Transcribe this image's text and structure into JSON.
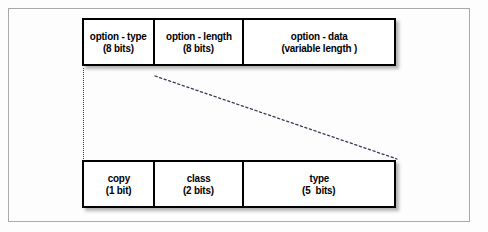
{
  "figure": {
    "frame_color": "#a9a9a9",
    "box_border_color": "#000000",
    "box_fill_color": "#ffffff",
    "text_color": "#000000",
    "connector_color": "#3a3a55"
  },
  "top_row": {
    "name": "option-format-row",
    "cells": [
      {
        "name": "option - type",
        "size": "(8 bits)"
      },
      {
        "name": "option - length",
        "size": "(8 bits)"
      },
      {
        "name": "option - data",
        "size": "(variable length )"
      }
    ]
  },
  "bottom_row": {
    "name": "option-type-detail-row",
    "cells": [
      {
        "name": "copy",
        "size": "(1 bit)"
      },
      {
        "name": "class",
        "size": "(2 bits)"
      },
      {
        "name": "type",
        "size": "(5  bits)"
      }
    ]
  },
  "connectors": [
    {
      "name": "vertical-dotted-line",
      "from_x": 83,
      "from_y": 68,
      "to_x": 83,
      "to_y": 159
    },
    {
      "name": "diagonal-dotted-line",
      "from_x": 155,
      "from_y": 76,
      "to_x": 397,
      "to_y": 159
    }
  ]
}
